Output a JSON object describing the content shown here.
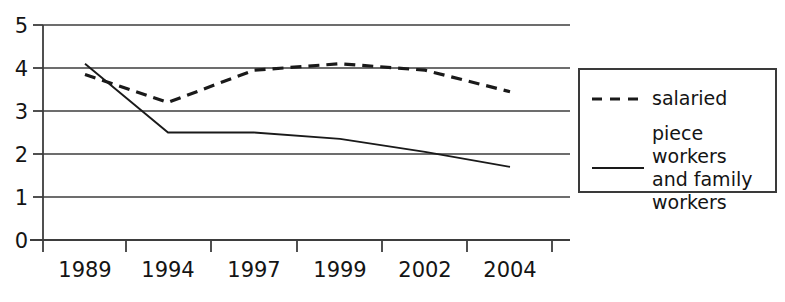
{
  "chart_data": {
    "type": "line",
    "title": "",
    "xlabel": "",
    "ylabel": "",
    "categories": [
      "1989",
      "1994",
      "1997",
      "1999",
      "2002",
      "2004"
    ],
    "ylim": [
      0,
      5
    ],
    "xlim": [
      0,
      6
    ],
    "y_ticks": [
      "0",
      "1",
      "2",
      "3",
      "4",
      "5"
    ],
    "grid": "horizontal",
    "legend_position": "right",
    "series": [
      {
        "name": "salaried",
        "style": "dashed",
        "color": "#1a1a1a",
        "values": [
          3.85,
          3.2,
          3.95,
          4.1,
          3.95,
          3.45
        ]
      },
      {
        "name": "piece workers\nand family\nworkers",
        "style": "solid",
        "color": "#1a1a1a",
        "values": [
          4.1,
          2.5,
          2.5,
          2.35,
          2.05,
          1.7
        ]
      }
    ]
  },
  "axes": {
    "y_ticks": [
      "5",
      "4",
      "3",
      "2",
      "1",
      "0"
    ],
    "x_ticks": [
      "1989",
      "1994",
      "1997",
      "1999",
      "2002",
      "2004"
    ]
  },
  "legend": {
    "items": [
      {
        "label": "salaried",
        "style": "dashed"
      },
      {
        "label": "piece workers\nand family\nworkers",
        "style": "solid"
      }
    ]
  }
}
